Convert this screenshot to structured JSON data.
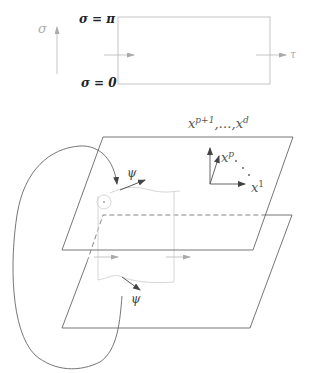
{
  "worldsheet": {
    "sigma_top_label": "σ = π",
    "sigma_bottom_label": "σ = 0",
    "sigma_axis_label": "σ",
    "tau_axis_label": "τ"
  },
  "branes": {
    "transverse_label_base": "x",
    "transverse_label_sup1": "p+1",
    "transverse_label_mid": ",…,x",
    "transverse_label_sup2": "d",
    "axis_xp_base": "x",
    "axis_xp_sup": "p",
    "axis_x1_base": "x",
    "axis_x1_sup": "1",
    "psi_upper": "ψ",
    "psi_lower": "ψ"
  },
  "colors": {
    "line": "#555555",
    "faint": "#bbbbbb",
    "very_faint": "#d6d6d6"
  }
}
